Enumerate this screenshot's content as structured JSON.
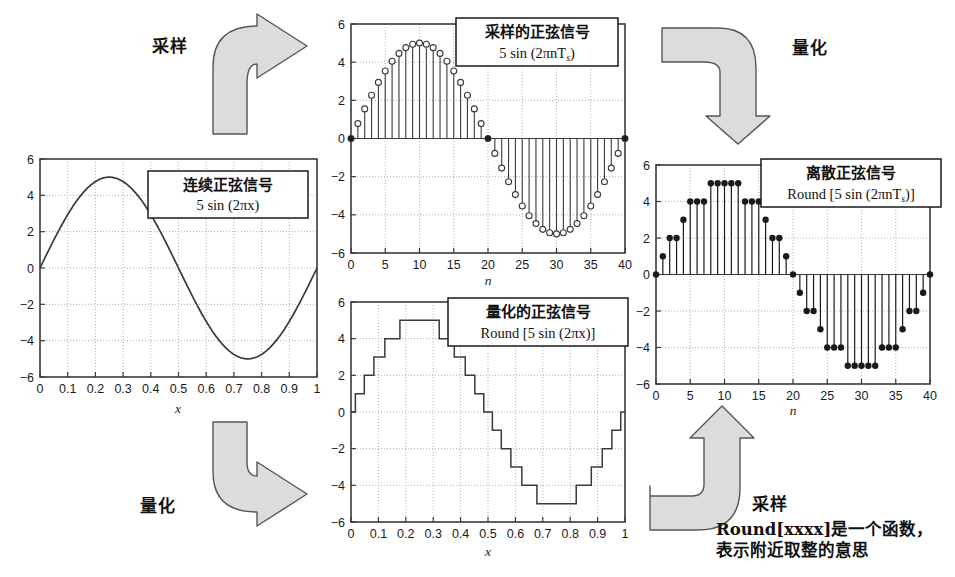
{
  "figure": {
    "title": "",
    "background": "#ffffff",
    "arrow_fill": "#dcdcdc",
    "arrow_stroke": "#555555",
    "axis_color": "#3a3a3a",
    "grid_color": "#9a9a9a",
    "curve_color": "#3a3a3a"
  },
  "arrows": [
    {
      "name": "sampling-top-left",
      "label": "采样",
      "direction": "up-right"
    },
    {
      "name": "quantization-top-right",
      "label": "量化",
      "direction": "right-down"
    },
    {
      "name": "quantization-bottom-left",
      "label": "量化",
      "direction": "down-right"
    },
    {
      "name": "sampling-bottom-right",
      "label": "采样",
      "direction": "left-up"
    }
  ],
  "footnote": {
    "line1": "Round[xxxx]是一个函数，",
    "line2": "表示附近取整的意思"
  },
  "charts": [
    {
      "id": "continuous",
      "caption_cn": "连续正弦信号",
      "caption_en": "5 sin (2πx)",
      "xlabel": "x",
      "ylabel": "",
      "xticks": [
        "0",
        "0.1",
        "0.2",
        "0.3",
        "0.4",
        "0.5",
        "0.6",
        "0.7",
        "0.8",
        "0.9",
        "1"
      ],
      "yticks": [
        "-6",
        "-4",
        "-2",
        "0",
        "2",
        "4",
        "6"
      ],
      "xlim": [
        0,
        1
      ],
      "ylim": [
        -6,
        6
      ]
    },
    {
      "id": "sampled",
      "caption_cn": "采样的正弦信号",
      "caption_en": "5 sin (2πnT",
      "caption_en_sub": "s",
      "caption_en_tail": ")",
      "xlabel": "n",
      "ylabel": "",
      "xticks": [
        "0",
        "5",
        "10",
        "15",
        "20",
        "25",
        "30",
        "35",
        "40"
      ],
      "yticks": [
        "-6",
        "-4",
        "-2",
        "0",
        "2",
        "4",
        "6"
      ],
      "xlim": [
        0,
        40
      ],
      "ylim": [
        -6,
        6
      ]
    },
    {
      "id": "quantized",
      "caption_cn": "量化的正弦信号",
      "caption_en": "Round [5 sin (2πx)]",
      "xlabel": "x",
      "ylabel": "",
      "xticks": [
        "0",
        "0.1",
        "0.2",
        "0.3",
        "0.4",
        "0.5",
        "0.6",
        "0.7",
        "0.8",
        "0.9",
        "1"
      ],
      "yticks": [
        "-6",
        "-4",
        "-2",
        "0",
        "2",
        "4",
        "6"
      ],
      "xlim": [
        0,
        1
      ],
      "ylim": [
        -6,
        6
      ]
    },
    {
      "id": "discrete",
      "caption_cn": "离散正弦信号",
      "caption_en": "Round [5 sin (2πnT",
      "caption_en_sub": "s",
      "caption_en_tail": ")]",
      "xlabel": "n",
      "ylabel": "",
      "xticks": [
        "0",
        "5",
        "10",
        "15",
        "20",
        "25",
        "30",
        "35",
        "40"
      ],
      "yticks": [
        "-6",
        "-4",
        "-2",
        "0",
        "2",
        "4",
        "6"
      ],
      "xlim": [
        0,
        40
      ],
      "ylim": [
        -6,
        6
      ]
    }
  ],
  "chart_data": [
    {
      "id": "continuous",
      "type": "line",
      "title": "连续正弦信号  5 sin (2πx)",
      "xlabel": "x",
      "ylabel": "",
      "xlim": [
        0,
        1
      ],
      "ylim": [
        -6,
        6
      ],
      "grid": true,
      "legend": "none",
      "formula": "y = 5*sin(2*pi*x)",
      "xticks": [
        0,
        0.1,
        0.2,
        0.3,
        0.4,
        0.5,
        0.6,
        0.7,
        0.8,
        0.9,
        1
      ],
      "yticks": [
        -6,
        -4,
        -2,
        0,
        2,
        4,
        6
      ],
      "x": [
        0,
        0.05,
        0.1,
        0.15,
        0.2,
        0.25,
        0.3,
        0.35,
        0.4,
        0.45,
        0.5,
        0.55,
        0.6,
        0.65,
        0.7,
        0.75,
        0.8,
        0.85,
        0.9,
        0.95,
        1
      ],
      "values": [
        0,
        1.55,
        2.94,
        4.05,
        4.76,
        5,
        4.76,
        4.05,
        2.94,
        1.55,
        0,
        -1.55,
        -2.94,
        -4.05,
        -4.76,
        -5,
        -4.76,
        -4.05,
        -2.94,
        -1.55,
        0
      ]
    },
    {
      "id": "sampled",
      "type": "scatter",
      "title": "采样的正弦信号  5 sin (2πnTs)",
      "xlabel": "n",
      "ylabel": "",
      "xlim": [
        0,
        40
      ],
      "ylim": [
        -6,
        6
      ],
      "grid": true,
      "legend": "none",
      "marker": "open-circle, stem to zero",
      "formula": "y[n] = 5*sin(2*pi*n/40)",
      "xticks": [
        0,
        5,
        10,
        15,
        20,
        25,
        30,
        35,
        40
      ],
      "yticks": [
        -6,
        -4,
        -2,
        0,
        2,
        4,
        6
      ],
      "x": [
        0,
        1,
        2,
        3,
        4,
        5,
        6,
        7,
        8,
        9,
        10,
        11,
        12,
        13,
        14,
        15,
        16,
        17,
        18,
        19,
        20,
        21,
        22,
        23,
        24,
        25,
        26,
        27,
        28,
        29,
        30,
        31,
        32,
        33,
        34,
        35,
        36,
        37,
        38,
        39,
        40
      ],
      "values": [
        0,
        0.78,
        1.55,
        2.27,
        2.94,
        3.54,
        4.05,
        4.46,
        4.76,
        4.94,
        5,
        4.94,
        4.76,
        4.46,
        4.05,
        3.54,
        2.94,
        2.27,
        1.55,
        0.78,
        0,
        -0.78,
        -1.55,
        -2.27,
        -2.94,
        -3.54,
        -4.05,
        -4.46,
        -4.76,
        -4.94,
        -5,
        -4.94,
        -4.76,
        -4.46,
        -4.05,
        -3.54,
        -2.94,
        -2.27,
        -1.55,
        -0.78,
        0
      ]
    },
    {
      "id": "quantized",
      "type": "line",
      "title": "量化的正弦信号  Round [5 sin (2πx)]",
      "xlabel": "x",
      "ylabel": "",
      "xlim": [
        0,
        1
      ],
      "ylim": [
        -6,
        6
      ],
      "grid": true,
      "legend": "none",
      "style": "staircase",
      "formula": "y = Round(5*sin(2*pi*x))",
      "xticks": [
        0,
        0.1,
        0.2,
        0.3,
        0.4,
        0.5,
        0.6,
        0.7,
        0.8,
        0.9,
        1
      ],
      "yticks": [
        -6,
        -4,
        -2,
        0,
        2,
        4,
        6
      ]
    },
    {
      "id": "discrete",
      "type": "scatter",
      "title": "离散正弦信号  Round [5 sin (2πnTs)]",
      "xlabel": "n",
      "ylabel": "",
      "xlim": [
        0,
        40
      ],
      "ylim": [
        -6,
        6
      ],
      "grid": true,
      "legend": "none",
      "marker": "filled-circle, stem to zero",
      "formula": "y[n] = Round(5*sin(2*pi*n/40))",
      "xticks": [
        0,
        5,
        10,
        15,
        20,
        25,
        30,
        35,
        40
      ],
      "yticks": [
        -6,
        -4,
        -2,
        0,
        2,
        4,
        6
      ],
      "x": [
        0,
        1,
        2,
        3,
        4,
        5,
        6,
        7,
        8,
        9,
        10,
        11,
        12,
        13,
        14,
        15,
        16,
        17,
        18,
        19,
        20,
        21,
        22,
        23,
        24,
        25,
        26,
        27,
        28,
        29,
        30,
        31,
        32,
        33,
        34,
        35,
        36,
        37,
        38,
        39,
        40
      ],
      "values": [
        0,
        1,
        2,
        2,
        3,
        4,
        4,
        4,
        5,
        5,
        5,
        5,
        5,
        4,
        4,
        4,
        3,
        2,
        2,
        1,
        0,
        -1,
        -2,
        -2,
        -3,
        -4,
        -4,
        -4,
        -5,
        -5,
        -5,
        -5,
        -5,
        -4,
        -4,
        -4,
        -3,
        -2,
        -2,
        -1,
        0
      ]
    }
  ]
}
